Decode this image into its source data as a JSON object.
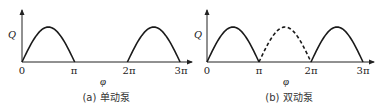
{
  "chart_data": [
    {
      "type": "line",
      "title": "(a) 单动泵",
      "xlabel": "φ",
      "ylabel": "Q",
      "x_ticks": [
        "0",
        "π",
        "2π",
        "3π"
      ],
      "xlim": [
        0,
        3.15
      ],
      "ylim": [
        0,
        1.4
      ],
      "grid": false,
      "series": [
        {
          "name": "stroke-1",
          "style": "solid",
          "x_range_pi": [
            0,
            1
          ],
          "shape": "half-sine",
          "peak": 1.0
        },
        {
          "name": "stroke-2",
          "style": "solid",
          "x_range_pi": [
            2,
            3
          ],
          "shape": "half-sine",
          "peak": 1.0
        }
      ]
    },
    {
      "type": "line",
      "title": "(b) 双动泵",
      "xlabel": "φ",
      "ylabel": "Q",
      "x_ticks": [
        "0",
        "π",
        "2π",
        "3π"
      ],
      "xlim": [
        0,
        3.15
      ],
      "ylim": [
        0,
        1.4
      ],
      "grid": false,
      "series": [
        {
          "name": "stroke-1",
          "style": "solid",
          "x_range_pi": [
            0,
            1
          ],
          "shape": "half-sine",
          "peak": 1.0
        },
        {
          "name": "stroke-2",
          "style": "dashed",
          "x_range_pi": [
            1,
            2
          ],
          "shape": "half-sine",
          "peak": 1.0
        },
        {
          "name": "stroke-3",
          "style": "solid",
          "x_range_pi": [
            2,
            3
          ],
          "shape": "half-sine",
          "peak": 1.0
        }
      ]
    }
  ]
}
